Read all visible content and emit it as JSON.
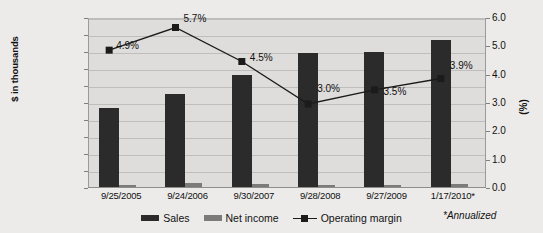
{
  "chart_data": {
    "type": "bar",
    "title": "",
    "xlabel": "",
    "ylabel": "$ in thousands",
    "ylabel_secondary": "(%)",
    "grid": true,
    "legend_position": "bottom",
    "categories": [
      "9/25/2005",
      "9/24/2006",
      "9/30/2007",
      "9/28/2008",
      "9/27/2009",
      "1/17/2010*"
    ],
    "ylim": [
      0,
      10000000
    ],
    "yticks": [
      "0",
      "1,000,000",
      "2,000,000",
      "3,000,000",
      "4,000,000",
      "5,000,000",
      "6,000,000",
      "7,000,000",
      "8,000,000",
      "9,000,000",
      "10,000,000"
    ],
    "ytick_values": [
      0,
      1000000,
      2000000,
      3000000,
      4000000,
      5000000,
      6000000,
      7000000,
      8000000,
      9000000,
      10000000
    ],
    "ylim_secondary": [
      0,
      6
    ],
    "yticks_secondary": [
      "0.0",
      "1.0",
      "2.0",
      "3.0",
      "4.0",
      "5.0",
      "6.0"
    ],
    "ytick_values_secondary": [
      0,
      1,
      2,
      3,
      4,
      5,
      6
    ],
    "series": [
      {
        "name": "Sales",
        "kind": "bar",
        "axis": "left",
        "color": "#2b2b2b",
        "values": [
          4650000,
          5500000,
          6600000,
          7900000,
          7950000,
          8650000
        ]
      },
      {
        "name": "Net income",
        "kind": "bar",
        "axis": "left",
        "color": "#7b7b79",
        "values": [
          130000,
          230000,
          190000,
          120000,
          140000,
          190000
        ]
      },
      {
        "name": "Operating margin",
        "kind": "line",
        "axis": "right",
        "color": "#1b1b1b",
        "marker": "square",
        "values": [
          4.9,
          5.7,
          4.5,
          3.0,
          3.5,
          3.9
        ],
        "labels": [
          "4.9%",
          "5.7%",
          "4.5%",
          "3.0%",
          "3.5%",
          "3.9%"
        ]
      }
    ],
    "annotations": [
      "*Annualized"
    ]
  },
  "legend": {
    "items": [
      {
        "label": "Sales"
      },
      {
        "label": "Net income"
      },
      {
        "label": "Operating margin"
      }
    ]
  },
  "footnote": {
    "text": "*Annualized"
  }
}
